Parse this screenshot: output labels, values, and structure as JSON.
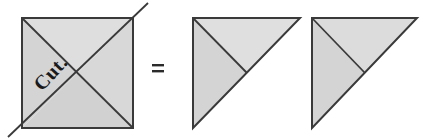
{
  "figure": {
    "caption_text": "Cut.",
    "equals_sign": "=",
    "colors": {
      "square_fill_light": "#dcdcdc",
      "square_fill_mid": "#d2d2d2",
      "triangle_fill_light": "#dedede",
      "triangle_fill_mid": "#d3d3d3",
      "stroke": "#3a3a3a",
      "text": "#1a1a1a",
      "background": "#ffffff"
    },
    "shapes": {
      "square": {
        "name": "square-with-diagonals",
        "x": 22,
        "y": 18,
        "width": 111,
        "height": 110,
        "diagonal_extension": 14
      },
      "triangle_left": {
        "name": "right-triangle-left",
        "vertices": "193,18 300,18 193,128",
        "cut_line": "193,18 247,73"
      },
      "triangle_right": {
        "name": "right-triangle-right",
        "vertices": "312,18 417,18 312,128",
        "cut_line": "312,18 365,73"
      }
    },
    "equals": {
      "x": 152,
      "y": 64,
      "width": 12
    }
  }
}
